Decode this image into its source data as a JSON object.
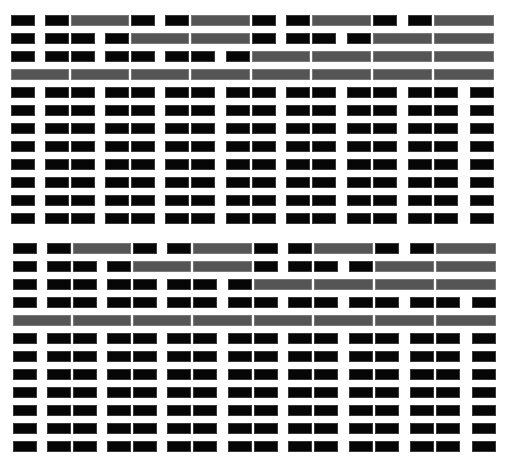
{
  "title": "",
  "colors": {
    "black": "#060606",
    "gray": "#555555",
    "background": "#ffffff"
  },
  "unit_offsets": [
    0,
    34,
    60,
    94,
    120,
    154,
    180,
    215,
    241,
    275,
    301,
    336,
    362,
    397,
    423,
    459
  ],
  "unit_width": 24,
  "row_pitch": 18,
  "blocks": [
    {
      "name": "block-1",
      "x0": 11,
      "y0": 15,
      "rows": [
        "b,b,g2,b,b,g2,b,b,g2,b,b,g2",
        "b,b,b,b,g2,g2,b,b,b,b,g2,g2",
        "b,b,b,b,b,b,b,b,g2,g2,g2,g2",
        "g2,g2,g2,g2,g2,g2,g2,g2",
        "b,b,b,b,b,b,b,b,b,b,b,b,b,b,b,b",
        "b,b,b,b,b,b,b,b,b,b,b,b,b,b,b,b",
        "b,b,b,b,b,b,b,b,b,b,b,b,b,b,b,b",
        "b,b,b,b,b,b,b,b,b,b,b,b,b,b,b,b",
        "b,b,b,b,b,b,b,b,b,b,b,b,b,b,b,b",
        "b,b,b,b,b,b,b,b,b,b,b,b,b,b,b,b",
        "b,b,b,b,b,b,b,b,b,b,b,b,b,b,b,b",
        "b,b,b,b,b,b,b,b,b,b,b,b,b,b,b,b"
      ]
    },
    {
      "name": "block-2",
      "x0": 13,
      "y0": 243,
      "rows": [
        "b,b,g2,b,b,g2,b,b,g2,b,b,g2",
        "b,b,b,b,g2,g2,b,b,b,b,g2,g2",
        "b,b,b,b,b,b,b,b,g2,g2,g2,g2",
        "b,b,b,b,b,b,b,b,b,b,b,b,b,b,b,b",
        "g2,g2,g2,g2,g2,g2,g2,g2",
        "b,b,b,b,b,b,b,b,b,b,b,b,b,b,b,b",
        "b,b,b,b,b,b,b,b,b,b,b,b,b,b,b,b",
        "b,b,b,b,b,b,b,b,b,b,b,b,b,b,b,b",
        "b,b,b,b,b,b,b,b,b,b,b,b,b,b,b,b",
        "b,b,b,b,b,b,b,b,b,b,b,b,b,b,b,b",
        "b,b,b,b,b,b,b,b,b,b,b,b,b,b,b,b",
        "b,b,b,b,b,b,b,b,b,b,b,b,b,b,b,b"
      ]
    }
  ]
}
